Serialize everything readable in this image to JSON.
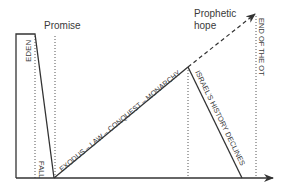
{
  "diagram": {
    "labels": {
      "eden": "EDEN",
      "promise": "Promise",
      "fall": "FALL",
      "ascent": "EXODUS – LAW – CONQUEST – MONARCHY",
      "decline": "ISRAEL'S HISTORY DECLINES",
      "prophetic_1": "Prophetic",
      "prophetic_2": "hope",
      "end": "END OF THE OT"
    },
    "colors": {
      "line": "#333333",
      "dotted": "#555555"
    }
  }
}
